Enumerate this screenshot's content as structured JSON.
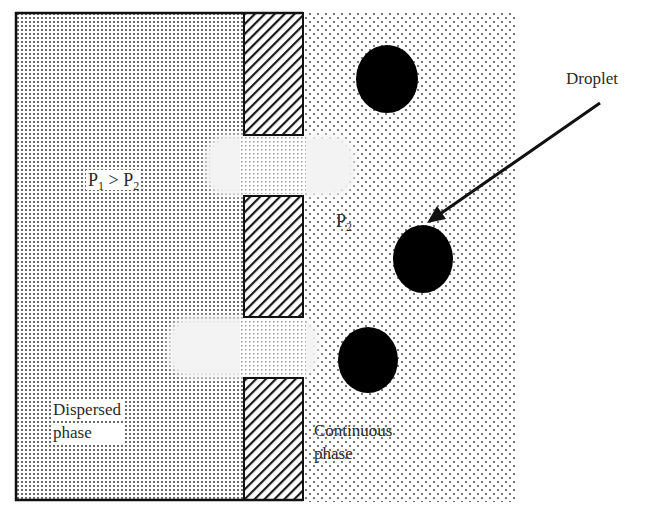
{
  "diagram": {
    "type": "membrane emulsification schematic",
    "labels": {
      "pressure_relation": {
        "p1": "P",
        "p1_sub": "1",
        "op": " > ",
        "p2": "P",
        "p2_sub": "2"
      },
      "continuous_pressure": {
        "p": "P",
        "sub": "2"
      },
      "droplet": "Droplet",
      "dispersed_phase_line1": "Dispersed",
      "dispersed_phase_line2": "phase",
      "continuous_phase_line1": "Continuous",
      "continuous_phase_line2": "phase"
    },
    "regions": {
      "dispersed_phase": {
        "x": 16,
        "y": 12,
        "w": 228,
        "h": 488,
        "pattern": "fine-dots"
      },
      "membrane_blocks": [
        {
          "x": 244,
          "y": 13,
          "w": 59,
          "h": 122
        },
        {
          "x": 244,
          "y": 196,
          "w": 59,
          "h": 121
        },
        {
          "x": 244,
          "y": 378,
          "w": 59,
          "h": 122
        }
      ],
      "pores": [
        {
          "y": 135,
          "h": 61
        },
        {
          "y": 317,
          "h": 61
        }
      ],
      "continuous_phase": {
        "x": 303,
        "y": 13,
        "w": 212,
        "h": 489,
        "pattern": "sparse-dots"
      }
    },
    "droplets": [
      {
        "cx": 387,
        "cy": 79,
        "rx": 31,
        "ry": 34
      },
      {
        "cx": 423,
        "cy": 259,
        "rx": 30,
        "ry": 34
      },
      {
        "cx": 368,
        "cy": 360,
        "rx": 30,
        "ry": 33
      }
    ],
    "arrow": {
      "x1": 600,
      "y1": 103,
      "x2": 428,
      "y2": 222
    },
    "colors": {
      "outline": "#111111",
      "droplet": "#000000",
      "dot": "#555555",
      "background": "#ffffff"
    }
  }
}
